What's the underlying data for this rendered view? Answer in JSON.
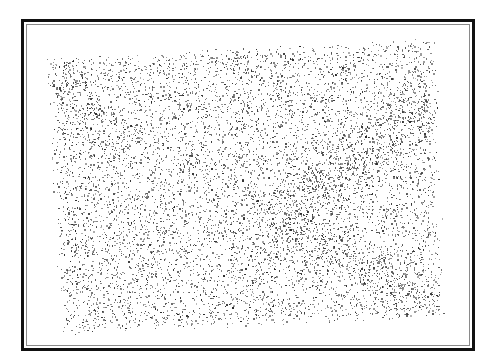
{
  "image": {
    "description": "Stippled halftone texture inside a double-line picture frame",
    "frame": {
      "outer_color": "#111111",
      "inner_color": "#8a8a8a",
      "background": "#ffffff"
    },
    "texture": {
      "dot_color": "#3a3a3a",
      "region_corners": [
        [
          45,
          57
        ],
        [
          437,
          37
        ],
        [
          445,
          318
        ],
        [
          60,
          335
        ]
      ],
      "dense_bands": [
        {
          "from": [
            300,
            200
          ],
          "to": [
            440,
            90
          ],
          "strength": 1.6
        },
        {
          "from": [
            280,
            220
          ],
          "to": [
            440,
            310
          ],
          "strength": 1.5
        },
        {
          "from": [
            45,
            60
          ],
          "to": [
            120,
            140
          ],
          "strength": 1.3
        }
      ],
      "dot_count": 9000,
      "seed": 7
    }
  }
}
